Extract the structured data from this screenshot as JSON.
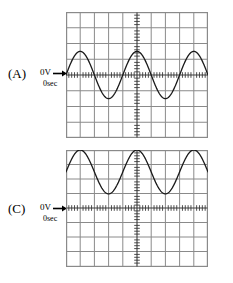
{
  "figure": {
    "background_color": "#ffffff",
    "grid_color": "#8a8a8a",
    "axis_color": "#555555",
    "trace_color": "#1a1a1a",
    "text_color": "#000000"
  },
  "panels": [
    {
      "id": "panel-a",
      "letter": "(A)",
      "zero_volt_label": "0V",
      "zero_sec_label": "0sec",
      "arrow_icon": "right-arrow-icon",
      "screen": {
        "x": 66,
        "y": 12,
        "width": 142,
        "height": 126,
        "columns": 10,
        "rows": 8,
        "center_column": 5,
        "center_row": 4,
        "axis_ticks_per_division": 5
      },
      "waveform": {
        "shape": "sine",
        "description": "AC sine wave centred on the 0 V line",
        "dc_offset_div": 0,
        "amplitude_div": 1.5,
        "cycles": 2.5,
        "phase_deg": 0,
        "baseline_row": 4,
        "peak_row": 2.5,
        "trough_row": 5.5
      }
    },
    {
      "id": "panel-c",
      "letter": "(C)",
      "zero_volt_label": "0V",
      "zero_sec_label": "0sec",
      "arrow_icon": "right-arrow-icon",
      "screen": {
        "x": 66,
        "y": 150,
        "width": 142,
        "height": 117,
        "columns": 10,
        "rows": 8,
        "center_column": 5,
        "center_row": 4,
        "axis_ticks_per_division": 5
      },
      "waveform": {
        "shape": "sine",
        "description": "Sine wave with positive DC offset, entirely above the 0 V line",
        "dc_offset_div": 2.5,
        "amplitude_div": 1.5,
        "cycles": 2.5,
        "phase_deg": 0,
        "baseline_row": 4,
        "peak_row": 0.5,
        "trough_row": 3.5
      }
    }
  ],
  "chart_data": {
    "type": "line",
    "xlabel": "time",
    "ylabel": "voltage",
    "grid": true,
    "grid_divisions_x": 10,
    "grid_divisions_y": 8,
    "legend_position": "left",
    "xlim": [
      0,
      10
    ],
    "ylim": [
      -4,
      4
    ],
    "annotations": [
      "0V",
      "0sec",
      "(A)",
      "(C)"
    ],
    "series": [
      {
        "name": "(A)",
        "form": "sine",
        "offset_div": 0,
        "amplitude_div": 1.5,
        "cycles": 2.5,
        "x": [
          0,
          0.5,
          1,
          1.5,
          2,
          2.5,
          3,
          3.5,
          4,
          4.5,
          5,
          5.5,
          6,
          6.5,
          7,
          7.5,
          8,
          8.5,
          9,
          9.5,
          10
        ],
        "values": [
          0,
          0.87,
          1.5,
          1.3,
          0.46,
          -0.46,
          -1.3,
          -1.5,
          -0.87,
          0,
          0.87,
          1.5,
          1.3,
          0.46,
          -0.46,
          -1.3,
          -1.5,
          -0.87,
          0,
          0.87,
          1.5
        ]
      },
      {
        "name": "(C)",
        "form": "sine-with-dc-offset",
        "offset_div": 2.5,
        "amplitude_div": 1.5,
        "cycles": 2.5,
        "x": [
          0,
          0.5,
          1,
          1.5,
          2,
          2.5,
          3,
          3.5,
          4,
          4.5,
          5,
          5.5,
          6,
          6.5,
          7,
          7.5,
          8,
          8.5,
          9,
          9.5,
          10
        ],
        "values": [
          2.5,
          3.37,
          4.0,
          3.8,
          2.96,
          2.04,
          1.2,
          1.0,
          1.63,
          2.5,
          3.37,
          4.0,
          3.8,
          2.96,
          2.04,
          1.2,
          1.0,
          1.63,
          2.5,
          3.37,
          4.0
        ]
      }
    ]
  }
}
